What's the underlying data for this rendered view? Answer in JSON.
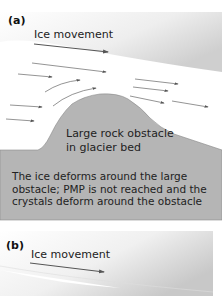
{
  "panel_a": {
    "label": "(a)",
    "ice_movement_label": "Ice movement",
    "obstacle_label_line1": "Large rock obstacle",
    "obstacle_label_line2": "in glacier bed",
    "caption_line1": "The ice deforms around the large",
    "caption_line2": "obstacle; PMP is not reached and the",
    "caption_line3": "crystals deform around the obstacle"
  },
  "panel_b": {
    "label": "(b)",
    "ice_movement_label": "Ice movement"
  },
  "colors": {
    "ice_gradient_dark": "#c9c9c9",
    "rock_fill": "#b4b4b4",
    "arrow": "#555555",
    "text": "#222222"
  }
}
